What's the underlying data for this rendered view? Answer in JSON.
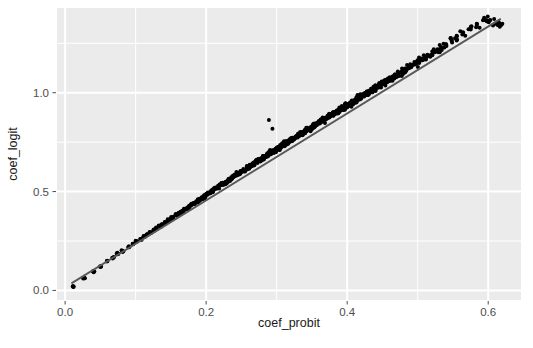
{
  "chart_data": {
    "type": "scatter",
    "title": "",
    "xlabel": "coef_probit",
    "ylabel": "coef_logit",
    "xlim": [
      -0.0115,
      0.6465
    ],
    "ylim": [
      -0.0485,
      1.4285
    ],
    "grid": true,
    "legend": null,
    "xticks": [
      0.0,
      0.2,
      0.4,
      0.6
    ],
    "xticklabels": [
      "0.0",
      "0.2",
      "0.4",
      "0.6"
    ],
    "yticks": [
      0.0,
      0.5,
      1.0
    ],
    "yticklabels": [
      "0.0",
      "0.5",
      "1.0"
    ],
    "minor_xticks": [
      0.1,
      0.3,
      0.5
    ],
    "minor_yticks": [
      0.25,
      0.75,
      1.25
    ],
    "panel_background": "#ebebeb",
    "gridline_color": "#ffffff",
    "point_color": "#000000",
    "point_size": 3.1,
    "line_color": "#595959",
    "line_width": 1.9,
    "fit_line": {
      "label": "fitted line",
      "x": [
        0.01,
        0.617
      ],
      "y": [
        0.038,
        1.372
      ],
      "slope": 2.198,
      "intercept": 0.016
    },
    "annotations": [
      {
        "label": "outlier-high-1",
        "x": 0.289,
        "y": 0.862
      },
      {
        "label": "outlier-high-2",
        "x": 0.294,
        "y": 0.818
      }
    ],
    "n_points": 1040,
    "points": [
      [
        0.012,
        0.021
      ],
      [
        0.027,
        0.062
      ],
      [
        0.04,
        0.095
      ],
      [
        0.05,
        0.122
      ],
      [
        0.06,
        0.146
      ],
      [
        0.068,
        0.166
      ],
      [
        0.075,
        0.185
      ],
      [
        0.082,
        0.2
      ],
      [
        0.09,
        0.219
      ],
      [
        0.096,
        0.236
      ],
      [
        0.101,
        0.247
      ],
      [
        0.107,
        0.261
      ],
      [
        0.112,
        0.272
      ],
      [
        0.116,
        0.282
      ],
      [
        0.121,
        0.293
      ],
      [
        0.126,
        0.305
      ],
      [
        0.13,
        0.315
      ],
      [
        0.134,
        0.324
      ],
      [
        0.138,
        0.334
      ],
      [
        0.142,
        0.343
      ],
      [
        0.146,
        0.353
      ],
      [
        0.15,
        0.362
      ],
      [
        0.153,
        0.37
      ],
      [
        0.157,
        0.38
      ],
      [
        0.16,
        0.386
      ],
      [
        0.163,
        0.394
      ],
      [
        0.166,
        0.401
      ],
      [
        0.17,
        0.41
      ],
      [
        0.173,
        0.417
      ],
      [
        0.176,
        0.424
      ],
      [
        0.179,
        0.431
      ],
      [
        0.182,
        0.438
      ],
      [
        0.185,
        0.445
      ],
      [
        0.188,
        0.452
      ],
      [
        0.19,
        0.458
      ],
      [
        0.193,
        0.465
      ],
      [
        0.196,
        0.472
      ],
      [
        0.198,
        0.477
      ],
      [
        0.201,
        0.484
      ],
      [
        0.204,
        0.491
      ],
      [
        0.206,
        0.496
      ],
      [
        0.209,
        0.503
      ],
      [
        0.211,
        0.508
      ],
      [
        0.214,
        0.515
      ],
      [
        0.216,
        0.52
      ],
      [
        0.219,
        0.527
      ],
      [
        0.221,
        0.532
      ],
      [
        0.224,
        0.539
      ],
      [
        0.226,
        0.543
      ],
      [
        0.228,
        0.548
      ],
      [
        0.231,
        0.555
      ],
      [
        0.233,
        0.56
      ],
      [
        0.235,
        0.565
      ],
      [
        0.238,
        0.572
      ],
      [
        0.24,
        0.577
      ],
      [
        0.242,
        0.582
      ],
      [
        0.245,
        0.588
      ],
      [
        0.247,
        0.593
      ],
      [
        0.249,
        0.598
      ],
      [
        0.251,
        0.603
      ],
      [
        0.253,
        0.607
      ],
      [
        0.256,
        0.614
      ],
      [
        0.258,
        0.619
      ],
      [
        0.26,
        0.624
      ],
      [
        0.262,
        0.628
      ],
      [
        0.264,
        0.633
      ],
      [
        0.266,
        0.638
      ],
      [
        0.268,
        0.642
      ],
      [
        0.271,
        0.649
      ],
      [
        0.273,
        0.654
      ],
      [
        0.275,
        0.658
      ],
      [
        0.277,
        0.663
      ],
      [
        0.279,
        0.667
      ],
      [
        0.281,
        0.672
      ],
      [
        0.283,
        0.677
      ],
      [
        0.285,
        0.681
      ],
      [
        0.287,
        0.686
      ],
      [
        0.289,
        0.69
      ],
      [
        0.291,
        0.695
      ],
      [
        0.293,
        0.699
      ],
      [
        0.295,
        0.704
      ],
      [
        0.297,
        0.708
      ],
      [
        0.299,
        0.713
      ],
      [
        0.301,
        0.717
      ],
      [
        0.303,
        0.722
      ],
      [
        0.305,
        0.726
      ],
      [
        0.307,
        0.731
      ],
      [
        0.309,
        0.735
      ],
      [
        0.311,
        0.74
      ],
      [
        0.313,
        0.744
      ],
      [
        0.315,
        0.749
      ],
      [
        0.317,
        0.753
      ],
      [
        0.319,
        0.758
      ],
      [
        0.321,
        0.762
      ],
      [
        0.323,
        0.766
      ],
      [
        0.325,
        0.771
      ],
      [
        0.327,
        0.775
      ],
      [
        0.329,
        0.78
      ],
      [
        0.331,
        0.784
      ],
      [
        0.333,
        0.789
      ],
      [
        0.335,
        0.793
      ],
      [
        0.337,
        0.797
      ],
      [
        0.339,
        0.802
      ],
      [
        0.341,
        0.806
      ],
      [
        0.343,
        0.811
      ],
      [
        0.345,
        0.815
      ],
      [
        0.347,
        0.819
      ],
      [
        0.349,
        0.824
      ],
      [
        0.351,
        0.828
      ],
      [
        0.353,
        0.833
      ],
      [
        0.355,
        0.837
      ],
      [
        0.357,
        0.841
      ],
      [
        0.359,
        0.846
      ],
      [
        0.361,
        0.85
      ],
      [
        0.363,
        0.855
      ],
      [
        0.365,
        0.859
      ],
      [
        0.367,
        0.863
      ],
      [
        0.369,
        0.868
      ],
      [
        0.371,
        0.872
      ],
      [
        0.373,
        0.877
      ],
      [
        0.375,
        0.881
      ],
      [
        0.377,
        0.885
      ],
      [
        0.379,
        0.89
      ],
      [
        0.381,
        0.894
      ],
      [
        0.383,
        0.899
      ],
      [
        0.385,
        0.903
      ],
      [
        0.387,
        0.907
      ],
      [
        0.389,
        0.912
      ],
      [
        0.391,
        0.916
      ],
      [
        0.393,
        0.921
      ],
      [
        0.395,
        0.925
      ],
      [
        0.397,
        0.929
      ],
      [
        0.399,
        0.934
      ],
      [
        0.401,
        0.938
      ],
      [
        0.403,
        0.943
      ],
      [
        0.405,
        0.947
      ],
      [
        0.407,
        0.951
      ],
      [
        0.409,
        0.956
      ],
      [
        0.411,
        0.96
      ],
      [
        0.413,
        0.965
      ],
      [
        0.415,
        0.969
      ],
      [
        0.417,
        0.973
      ],
      [
        0.419,
        0.978
      ],
      [
        0.421,
        0.982
      ],
      [
        0.423,
        0.987
      ],
      [
        0.425,
        0.991
      ],
      [
        0.427,
        0.995
      ],
      [
        0.429,
        1.0
      ],
      [
        0.431,
        1.004
      ],
      [
        0.433,
        1.009
      ],
      [
        0.435,
        1.013
      ],
      [
        0.437,
        1.017
      ],
      [
        0.439,
        1.022
      ],
      [
        0.441,
        1.026
      ],
      [
        0.443,
        1.031
      ],
      [
        0.445,
        1.035
      ],
      [
        0.447,
        1.039
      ],
      [
        0.449,
        1.044
      ],
      [
        0.451,
        1.048
      ],
      [
        0.453,
        1.053
      ],
      [
        0.455,
        1.057
      ],
      [
        0.457,
        1.061
      ],
      [
        0.459,
        1.066
      ],
      [
        0.461,
        1.07
      ],
      [
        0.463,
        1.075
      ],
      [
        0.465,
        1.079
      ],
      [
        0.467,
        1.083
      ],
      [
        0.47,
        1.09
      ],
      [
        0.473,
        1.096
      ],
      [
        0.476,
        1.103
      ],
      [
        0.479,
        1.11
      ],
      [
        0.482,
        1.116
      ],
      [
        0.485,
        1.123
      ],
      [
        0.488,
        1.129
      ],
      [
        0.491,
        1.136
      ],
      [
        0.494,
        1.142
      ],
      [
        0.497,
        1.149
      ],
      [
        0.5,
        1.155
      ],
      [
        0.505,
        1.166
      ],
      [
        0.51,
        1.177
      ],
      [
        0.515,
        1.188
      ],
      [
        0.52,
        1.199
      ],
      [
        0.525,
        1.21
      ],
      [
        0.53,
        1.221
      ],
      [
        0.535,
        1.232
      ],
      [
        0.54,
        1.243
      ],
      [
        0.548,
        1.261
      ],
      [
        0.556,
        1.278
      ],
      [
        0.565,
        1.298
      ],
      [
        0.575,
        1.32
      ],
      [
        0.585,
        1.342
      ],
      [
        0.596,
        1.366
      ],
      [
        0.605,
        1.37
      ],
      [
        0.612,
        1.34
      ],
      [
        0.617,
        1.338
      ],
      [
        0.289,
        0.862
      ],
      [
        0.294,
        0.818
      ]
    ]
  },
  "axis": {
    "x_title": "coef_probit",
    "y_title": "coef_logit"
  }
}
